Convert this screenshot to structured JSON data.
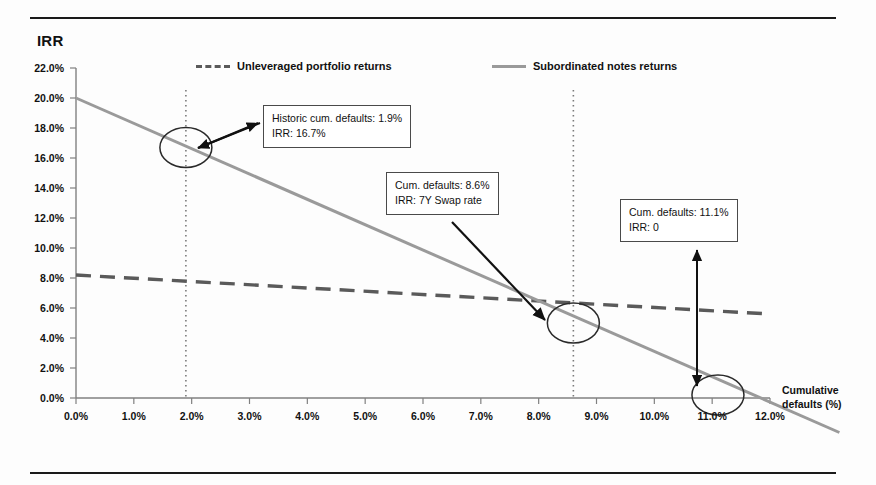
{
  "page": {
    "ghost_header": "",
    "background": "#fdfdfd",
    "rules_color": "#1a1a1a"
  },
  "chart_data": {
    "type": "line",
    "title": "",
    "ylabel": "IRR",
    "xlabel": "Cumulative defaults (%)",
    "xlim": [
      0.0,
      12.0
    ],
    "ylim": [
      0.0,
      22.0
    ],
    "xticks": [
      "0.0%",
      "1.0%",
      "2.0%",
      "3.0%",
      "4.0%",
      "5.0%",
      "6.0%",
      "7.0%",
      "8.0%",
      "9.0%",
      "10.0%",
      "11.0%",
      "12.0%"
    ],
    "yticks": [
      "0.0%",
      "2.0%",
      "4.0%",
      "6.0%",
      "8.0%",
      "10.0%",
      "12.0%",
      "14.0%",
      "16.0%",
      "18.0%",
      "20.0%",
      "22.0%"
    ],
    "grid": false,
    "legend_position": "top-inside",
    "series": [
      {
        "name": "Unleveraged portfolio returns",
        "style": "dashed",
        "color": "#5a5a5a",
        "x": [
          0.0,
          12.0
        ],
        "y": [
          8.2,
          5.6
        ]
      },
      {
        "name": "Subordinated notes returns",
        "style": "solid",
        "color": "#9a9a9a",
        "x": [
          0.0,
          13.2
        ],
        "y": [
          20.0,
          -2.3
        ]
      }
    ],
    "markers": [
      {
        "label": "historic-defaults-marker",
        "x": 1.9,
        "y": 16.7
      },
      {
        "label": "swap-rate-marker",
        "x": 8.6,
        "y": 5.0
      },
      {
        "label": "zero-irr-marker",
        "x": 11.1,
        "y": 0.2
      }
    ],
    "reference_lines": [
      {
        "type": "vertical",
        "x": 1.9,
        "style": "dotted"
      },
      {
        "type": "vertical",
        "x": 8.6,
        "style": "dotted"
      }
    ],
    "annotations": [
      {
        "id": "callout-historic",
        "line1": "Historic cum. defaults: 1.9%",
        "line2": "IRR: 16.7%"
      },
      {
        "id": "callout-swap",
        "line1": "Cum. defaults: 8.6%",
        "line2": "IRR: 7Y Swap rate"
      },
      {
        "id": "callout-zero",
        "line1": "Cum. defaults: 11.1%",
        "line2": "IRR: 0"
      }
    ]
  }
}
